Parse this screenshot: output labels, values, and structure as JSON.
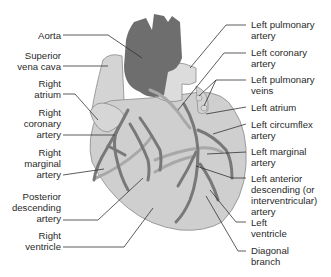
{
  "diagram": {
    "colors": {
      "heart_fill": "#cfcfcf",
      "heart_outline": "#8a8a8a",
      "aorta_fill": "#6e6e6e",
      "artery_stroke": "#7a7a7a",
      "vein_stroke": "#a8a8a8",
      "leader_line": "#333333",
      "text": "#2a2a2a"
    },
    "left_labels": [
      {
        "lines": [
          "Aorta"
        ]
      },
      {
        "lines": [
          "Superior",
          "vena cava"
        ]
      },
      {
        "lines": [
          "Right",
          "atrium"
        ]
      },
      {
        "lines": [
          "Right",
          "coronary",
          "artery"
        ]
      },
      {
        "lines": [
          "Right",
          "marginal",
          "artery"
        ]
      },
      {
        "lines": [
          "Posterior",
          "descending",
          "artery"
        ]
      },
      {
        "lines": [
          "Right",
          "ventricle"
        ]
      }
    ],
    "right_labels": [
      {
        "lines": [
          "Left pulmonary",
          "artery"
        ]
      },
      {
        "lines": [
          "Left coronary",
          "artery"
        ]
      },
      {
        "lines": [
          "Left pulmonary",
          "veins"
        ]
      },
      {
        "lines": [
          "Left atrium"
        ]
      },
      {
        "lines": [
          "Left circumflex",
          "artery"
        ]
      },
      {
        "lines": [
          "Left marginal",
          "artery"
        ]
      },
      {
        "lines": [
          "Left anterior",
          "descending (or",
          "interventricular)",
          "artery"
        ]
      },
      {
        "lines": [
          "Left",
          "ventricle"
        ]
      },
      {
        "lines": [
          "Diagonal",
          "branch"
        ]
      }
    ]
  }
}
